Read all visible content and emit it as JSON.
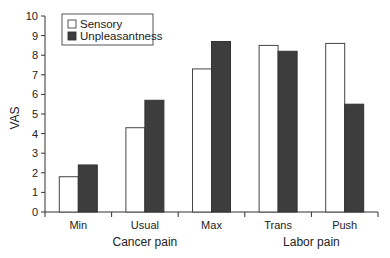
{
  "chart_data": {
    "type": "bar",
    "title": "",
    "xlabel": "",
    "ylabel": "VAS",
    "ylim": [
      0,
      10
    ],
    "yticks": [
      0,
      1,
      2,
      3,
      4,
      5,
      6,
      7,
      8,
      9,
      10
    ],
    "grid": false,
    "legend_position": "upper left",
    "categories": [
      "Min",
      "Usual",
      "Max",
      "Trans",
      "Push"
    ],
    "category_groups": [
      {
        "label": "Cancer pain",
        "categories": [
          "Min",
          "Usual",
          "Max"
        ]
      },
      {
        "label": "Labor pain",
        "categories": [
          "Trans",
          "Push"
        ]
      }
    ],
    "series": [
      {
        "name": "Sensory",
        "color": "#ffffff",
        "edge": "#444444",
        "values": [
          1.8,
          4.3,
          7.3,
          8.5,
          8.6
        ]
      },
      {
        "name": "Unpleasantness",
        "color": "#3d3d3d",
        "edge": "#333333",
        "values": [
          2.4,
          5.7,
          8.7,
          8.2,
          5.5
        ]
      }
    ]
  }
}
